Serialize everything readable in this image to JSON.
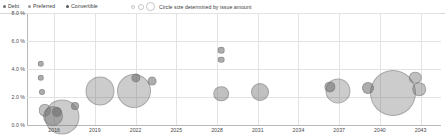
{
  "legend": {
    "items": [
      {
        "label": "Debt",
        "color": "#6f6f6f"
      },
      {
        "label": "Preferred",
        "color": "#9a9a9a"
      },
      {
        "label": "Convertible",
        "color": "#575757"
      }
    ],
    "note": "Circle size determined by issue amount"
  },
  "chart_data": {
    "type": "scatter",
    "title": "",
    "xlabel": "",
    "ylabel": "",
    "xlim": [
      2014,
      2044.5
    ],
    "ylim": [
      0,
      8
    ],
    "grid": true,
    "legend_position": "top-left",
    "ytick_labels": [
      "8.0 %",
      "6.0 %",
      "4.0 %",
      "2.0 %",
      "0.0 %"
    ],
    "ytick_values": [
      8,
      6,
      4,
      2,
      0
    ],
    "xtick_labels": [
      "2016",
      "2019",
      "2022",
      "2025",
      "2028",
      "2031",
      "2034",
      "2037",
      "2040",
      "2043"
    ],
    "xtick_values": [
      2016,
      2019,
      2022,
      2025,
      2028,
      2031,
      2034,
      2037,
      2040,
      2043
    ],
    "size_note": "Circle size determined by issue amount",
    "series": [
      {
        "name": "Debt",
        "color": "#6f6f6f",
        "points": [
          {
            "x": 2015.0,
            "y": 4.35,
            "r": 2.2
          },
          {
            "x": 2015.0,
            "y": 3.35,
            "r": 2.2
          },
          {
            "x": 2015.1,
            "y": 2.35,
            "r": 2.0
          },
          {
            "x": 2015.3,
            "y": 1.05,
            "r": 5.2
          },
          {
            "x": 2015.9,
            "y": 0.62,
            "r": 9.0
          },
          {
            "x": 2016.6,
            "y": 0.55,
            "r": 16.5
          },
          {
            "x": 2016.2,
            "y": 0.95,
            "r": 4.0
          },
          {
            "x": 2017.5,
            "y": 1.35,
            "r": 3.0
          },
          {
            "x": 2019.4,
            "y": 2.45,
            "r": 13.5
          },
          {
            "x": 2021.9,
            "y": 2.45,
            "r": 16.0
          },
          {
            "x": 2022.0,
            "y": 3.35,
            "r": 3.6
          },
          {
            "x": 2023.2,
            "y": 3.15,
            "r": 3.4
          },
          {
            "x": 2028.3,
            "y": 5.35,
            "r": 2.3
          },
          {
            "x": 2028.3,
            "y": 4.65,
            "r": 2.3
          },
          {
            "x": 2028.3,
            "y": 2.25,
            "r": 6.8
          },
          {
            "x": 2031.2,
            "y": 2.35,
            "r": 8.0
          },
          {
            "x": 2036.9,
            "y": 2.45,
            "r": 11.5
          },
          {
            "x": 2036.3,
            "y": 2.75,
            "r": 4.6
          },
          {
            "x": 2039.1,
            "y": 2.65,
            "r": 5.0
          },
          {
            "x": 2041.0,
            "y": 2.3,
            "r": 22.0
          },
          {
            "x": 2042.6,
            "y": 3.35,
            "r": 5.2
          },
          {
            "x": 2042.9,
            "y": 2.55,
            "r": 5.8
          }
        ]
      }
    ]
  }
}
